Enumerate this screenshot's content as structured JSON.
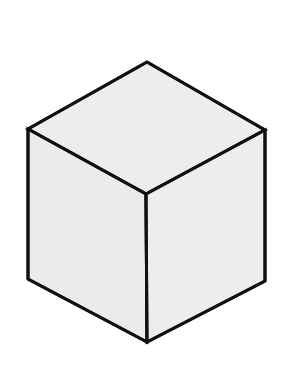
{
  "canvas": {
    "width": 289,
    "height": 389,
    "background_color": "#ffffff",
    "title": "Isometric Cube"
  },
  "figure": {
    "name": "isometric-cube",
    "stroke_color": "#111111",
    "stroke_width": 3,
    "vertices": {
      "top_apex": [
        147,
        62
      ],
      "upper_left": [
        28,
        129
      ],
      "upper_right": [
        265,
        130
      ],
      "center": [
        146,
        194
      ],
      "lower_left": [
        28,
        279
      ],
      "lower_right": [
        265,
        281
      ],
      "bottom_apex": [
        147,
        342
      ]
    },
    "faces": [
      {
        "name": "top-face",
        "label": "Top face",
        "fill_color": "#ededed",
        "points": "147,62 265,130 146,194 28,129"
      },
      {
        "name": "left-face",
        "label": "Left face",
        "fill_color": "#ebebeb",
        "points": "28,129 146,194 147,342 28,279"
      },
      {
        "name": "right-face",
        "label": "Right face",
        "fill_color": "#ededed",
        "points": "146,194 265,130 265,281 147,342"
      }
    ],
    "edges": [
      {
        "name": "edge-top-left",
        "x1": 147,
        "y1": 62,
        "x2": 28,
        "y2": 129
      },
      {
        "name": "edge-top-right",
        "x1": 147,
        "y1": 62,
        "x2": 265,
        "y2": 130
      },
      {
        "name": "edge-center-left",
        "x1": 28,
        "y1": 129,
        "x2": 146,
        "y2": 194
      },
      {
        "name": "edge-center-right",
        "x1": 265,
        "y1": 130,
        "x2": 146,
        "y2": 194
      },
      {
        "name": "edge-vertical-left",
        "x1": 28,
        "y1": 129,
        "x2": 28,
        "y2": 279
      },
      {
        "name": "edge-vertical-right",
        "x1": 265,
        "y1": 130,
        "x2": 265,
        "y2": 281
      },
      {
        "name": "edge-vertical-center",
        "x1": 146,
        "y1": 194,
        "x2": 147,
        "y2": 342
      },
      {
        "name": "edge-bottom-left",
        "x1": 28,
        "y1": 279,
        "x2": 147,
        "y2": 342
      },
      {
        "name": "edge-bottom-right",
        "x1": 265,
        "y1": 281,
        "x2": 147,
        "y2": 342
      }
    ]
  }
}
